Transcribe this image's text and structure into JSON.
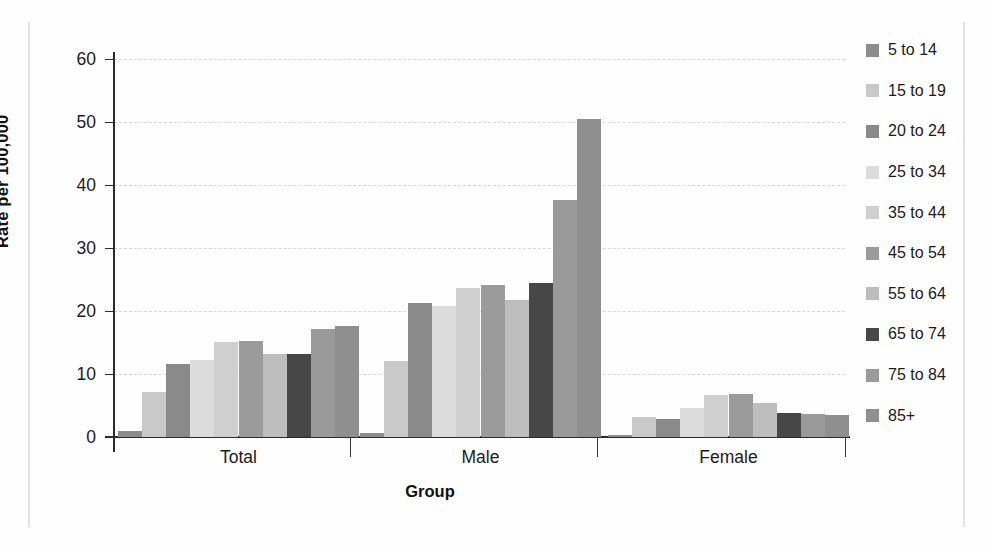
{
  "chart_data": {
    "type": "bar",
    "title": "",
    "xlabel": "Group",
    "ylabel": "Rate per 100,000",
    "categories": [
      "Total",
      "Male",
      "Female"
    ],
    "ylim": [
      0,
      60
    ],
    "yticks": [
      0,
      10,
      20,
      30,
      40,
      50,
      60
    ],
    "grid": true,
    "legend_position": "right",
    "series": [
      {
        "name": "5 to 14",
        "color": "#8d8d8d",
        "values": [
          1.0,
          0.7,
          0.3
        ]
      },
      {
        "name": "15 to 19",
        "color": "#c9c9c9",
        "values": [
          7.2,
          12.1,
          3.1
        ]
      },
      {
        "name": "20 to 24",
        "color": "#8a8a8a",
        "values": [
          11.6,
          21.2,
          2.9
        ]
      },
      {
        "name": "25 to 34",
        "color": "#dcdcdc",
        "values": [
          12.3,
          20.8,
          4.6
        ]
      },
      {
        "name": "35 to 44",
        "color": "#cfcfcf",
        "values": [
          15.1,
          23.7,
          6.6
        ]
      },
      {
        "name": "45 to 54",
        "color": "#9b9b9b",
        "values": [
          15.3,
          24.1,
          6.9
        ]
      },
      {
        "name": "55 to 64",
        "color": "#bdbdbd",
        "values": [
          13.2,
          21.8,
          5.4
        ]
      },
      {
        "name": "65 to 74",
        "color": "#474747",
        "values": [
          13.2,
          24.5,
          3.8
        ]
      },
      {
        "name": "75 to 84",
        "color": "#9a9a9a",
        "values": [
          17.2,
          37.6,
          3.7
        ]
      },
      {
        "name": "85+",
        "color": "#8f8f8f",
        "values": [
          17.6,
          50.4,
          3.5
        ]
      }
    ]
  },
  "axis": {
    "y_label": "Rate per 100,000",
    "x_label": "Group",
    "tick_labels": [
      "0",
      "10",
      "20",
      "30",
      "40",
      "50",
      "60"
    ]
  },
  "groups": {
    "labels": [
      "Total",
      "Male",
      "Female"
    ]
  },
  "legend": {
    "entries": [
      {
        "label": "5 to 14"
      },
      {
        "label": "15 to 19"
      },
      {
        "label": "20 to 24"
      },
      {
        "label": "25 to 34"
      },
      {
        "label": "35 to 44"
      },
      {
        "label": "45 to 54"
      },
      {
        "label": "55 to 64"
      },
      {
        "label": "65 to 74"
      },
      {
        "label": "75 to 84"
      },
      {
        "label": "85+"
      }
    ]
  }
}
